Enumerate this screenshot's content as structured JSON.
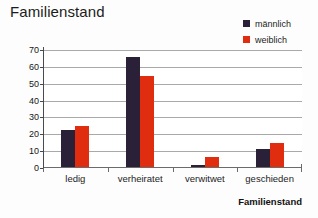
{
  "chart_data": {
    "type": "bar",
    "title": "Familienstand",
    "xlabel": "Familienstand",
    "ylabel": "% der Patienten",
    "categories": [
      "ledig",
      "verheiratet",
      "verwitwet",
      "geschieden"
    ],
    "series": [
      {
        "name": "männlich",
        "color": "#2a2037",
        "values": [
          22.2,
          65.5,
          1.3,
          10.8
        ]
      },
      {
        "name": "weiblich",
        "color": "#e02d10",
        "values": [
          24.5,
          54.0,
          6.2,
          14.2
        ]
      }
    ],
    "ylim": [
      0,
      70
    ],
    "yticks": [
      0,
      10,
      20,
      30,
      40,
      50,
      60,
      70
    ],
    "ytick_labels": [
      "0",
      "10",
      "20",
      "30",
      "40",
      "50",
      "60",
      "70"
    ],
    "grid": "horizontal",
    "legend_position": "top-right"
  },
  "legend": {
    "entries": [
      {
        "label": "männlich",
        "color": "#2a2037"
      },
      {
        "label": "weiblich",
        "color": "#e02d10"
      }
    ]
  },
  "colors": {
    "male": "#2a2037",
    "female": "#e02d10",
    "gridline": "#a9a9a9",
    "axis": "#4a4a4a",
    "background": "#fdfdfd"
  }
}
